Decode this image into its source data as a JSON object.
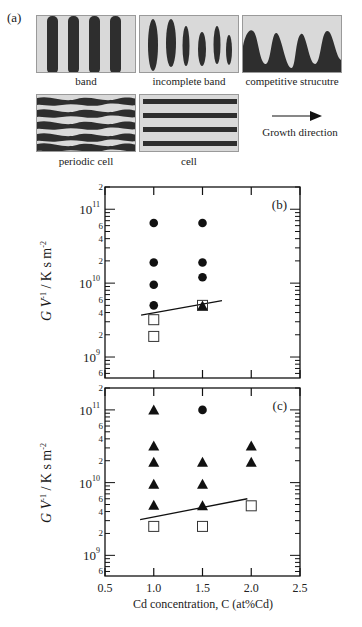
{
  "figure": {
    "panel_a": {
      "label": "(a)",
      "structures": [
        {
          "name": "band",
          "caption": "band"
        },
        {
          "name": "incomplete-band",
          "caption": "incomplete band"
        },
        {
          "name": "competitive-structure",
          "caption": "competitive strucutre"
        },
        {
          "name": "periodic-cell",
          "caption": "periodic cell"
        },
        {
          "name": "cell",
          "caption": "cell"
        }
      ],
      "growth_direction_label": "Growth direction",
      "colors": {
        "phase": "#2e2e2e",
        "matrix": "#d9d9d9"
      }
    }
  },
  "chart_data": [
    {
      "type": "scatter",
      "panel_label": "(b)",
      "title": "",
      "xlabel": "Cd concentration, C (at%Cd)",
      "ylabel": "G V^-1 / K s m^-2",
      "xlim": [
        0.5,
        2.5
      ],
      "ylim": [
        520000000.0,
        200000000000.0
      ],
      "yscale": "log",
      "x_ticks": [
        0.5,
        1.0,
        1.5,
        2.0,
        2.5
      ],
      "y_decade_labels": [
        "10^9",
        "10^10",
        "10^11"
      ],
      "y_minor_labels": [
        "6",
        "2",
        "4",
        "6",
        "2",
        "4",
        "6",
        "2"
      ],
      "grid": false,
      "series": [
        {
          "name": "periodic cell / band (filled circle)",
          "marker": "circle-filled",
          "points": [
            [
              1.0,
              65000000000.0
            ],
            [
              1.0,
              19000000000.0
            ],
            [
              1.0,
              9500000000.0
            ],
            [
              1.0,
              5000000000.0
            ],
            [
              1.5,
              65000000000.0
            ],
            [
              1.5,
              19000000000.0
            ],
            [
              1.5,
              12000000000.0
            ]
          ]
        },
        {
          "name": "filled triangle",
          "marker": "triangle-filled",
          "points": [
            [
              1.5,
              4900000000.0
            ]
          ]
        },
        {
          "name": "cell (open square)",
          "marker": "square-open",
          "points": [
            [
              1.0,
              3200000000.0
            ],
            [
              1.0,
              1900000000.0
            ],
            [
              1.5,
              5000000000.0
            ]
          ]
        }
      ],
      "boundary_line": [
        [
          0.87,
          3700000000.0
        ],
        [
          1.7,
          5800000000.0
        ]
      ]
    },
    {
      "type": "scatter",
      "panel_label": "(c)",
      "title": "",
      "xlabel": "Cd concentration, C (at%Cd)",
      "ylabel": "G V^-1 / K s m^-2",
      "xlim": [
        0.5,
        2.5
      ],
      "ylim": [
        520000000.0,
        200000000000.0
      ],
      "yscale": "log",
      "x_ticks": [
        0.5,
        1.0,
        1.5,
        2.0,
        2.5
      ],
      "x_tick_labels": [
        "0.5",
        "1.0",
        "1.5",
        "2.0",
        "2.5"
      ],
      "y_decade_labels": [
        "10^9",
        "10^10",
        "10^11"
      ],
      "grid": false,
      "series": [
        {
          "name": "filled circle",
          "marker": "circle-filled",
          "points": [
            [
              1.5,
              100000000000.0
            ]
          ]
        },
        {
          "name": "filled triangle",
          "marker": "triangle-filled",
          "points": [
            [
              1.0,
              100000000000.0
            ],
            [
              1.0,
              32000000000.0
            ],
            [
              1.0,
              19000000000.0
            ],
            [
              1.0,
              9500000000.0
            ],
            [
              1.0,
              4900000000.0
            ],
            [
              1.5,
              19000000000.0
            ],
            [
              1.5,
              9500000000.0
            ],
            [
              1.5,
              4800000000.0
            ],
            [
              2.0,
              32000000000.0
            ],
            [
              2.0,
              19000000000.0
            ]
          ]
        },
        {
          "name": "cell (open square)",
          "marker": "square-open",
          "points": [
            [
              1.0,
              2500000000.0
            ],
            [
              1.5,
              2500000000.0
            ],
            [
              2.0,
              4800000000.0
            ]
          ]
        }
      ],
      "boundary_line": [
        [
          0.86,
          3100000000.0
        ],
        [
          1.96,
          6000000000.0
        ]
      ]
    }
  ],
  "axis_text": {
    "ylabel_main": "G V",
    "ylabel_sup": "-1",
    "ylabel_units": " / K s m",
    "ylabel_units_sup": "-2",
    "xlabel": "Cd concentration, C (at%Cd)",
    "x_tick_labels": [
      "0.5",
      "1.0",
      "1.5",
      "2.0",
      "2.5"
    ]
  }
}
